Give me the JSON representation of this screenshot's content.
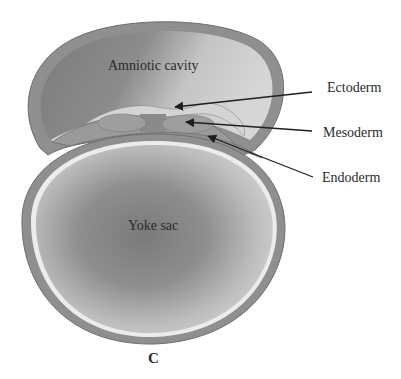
{
  "diagram": {
    "panel_label": "C",
    "structures": {
      "amniotic_cavity": "Amniotic cavity",
      "yolk_sac": "Yoke sac"
    },
    "callouts": [
      {
        "label": "Ectoderm"
      },
      {
        "label": "Mesoderm"
      },
      {
        "label": "Endoderm"
      }
    ],
    "colors": {
      "outer_wall": "#8f8f8f",
      "wall_stroke": "#6e6e6e",
      "endoderm_line": "#ececec",
      "ectoderm_fill": "#d4d4d4",
      "mesoderm_fill": "#9a9a9a",
      "arrow": "#1e1e1e"
    }
  }
}
